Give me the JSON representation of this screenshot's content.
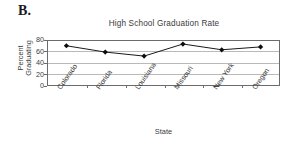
{
  "panel": {
    "letter": "B."
  },
  "chart_data": {
    "type": "line",
    "title": "High School Graduation Rate",
    "xlabel": "State",
    "ylabel": "Percent Graduating",
    "ylabel_line1": "Percent",
    "ylabel_line2": "Graduating",
    "categories": [
      "Colorado",
      "Florida",
      "Louisiana",
      "Missouri",
      "New York",
      "Oregon"
    ],
    "values": [
      70,
      59,
      52,
      73,
      63,
      68
    ],
    "series": [
      {
        "name": "Percent Graduating",
        "values": [
          70,
          59,
          52,
          73,
          63,
          68
        ]
      }
    ],
    "ylim": [
      0,
      80
    ],
    "yticks": [
      0,
      20,
      40,
      60,
      80
    ],
    "ytick_labels": [
      "0",
      "20",
      "40",
      "60",
      "80"
    ],
    "grid": true,
    "grid_axis": "y",
    "legend": false,
    "legend_position": "none",
    "marker": "diamond",
    "line_color": "#1a1a1a",
    "marker_color": "#0d0d0d",
    "grid_color": "#b9b9b9",
    "axis_color": "#6b6b6b",
    "text_color": "#3b3b3b",
    "background": "#ffffff"
  }
}
